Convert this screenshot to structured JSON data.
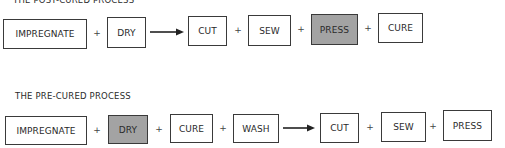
{
  "post_cured": {
    "title": "THE POST-CURED PROCESS",
    "steps": [
      {
        "label": "IMPREGNATE",
        "shaded": false
      },
      {
        "label": "DRY",
        "shaded": false
      },
      {
        "label": "CUT",
        "shaded": false
      },
      {
        "label": "SEW",
        "shaded": false
      },
      {
        "label": "PRESS",
        "shaded": true
      },
      {
        "label": "CURE",
        "shaded": false
      }
    ],
    "connectors": [
      "+",
      "→",
      "+",
      "+",
      "+"
    ]
  },
  "pre_cured": {
    "title": "THE PRE-CURED PROCESS",
    "steps": [
      {
        "label": "IMPREGNATE",
        "shaded": false
      },
      {
        "label": "DRY",
        "shaded": true
      },
      {
        "label": "CURE",
        "shaded": false
      },
      {
        "label": "WASH",
        "shaded": false
      },
      {
        "label": "CUT",
        "shaded": false
      },
      {
        "label": "SEW",
        "shaded": false
      },
      {
        "label": "PRESS",
        "shaded": false
      }
    ],
    "connectors": [
      "+",
      "+",
      "+",
      "→",
      "+",
      "+"
    ]
  },
  "plus_symbol": "+",
  "colors": {
    "shaded": "#a3a3a3",
    "border": "#3a3a3a"
  }
}
